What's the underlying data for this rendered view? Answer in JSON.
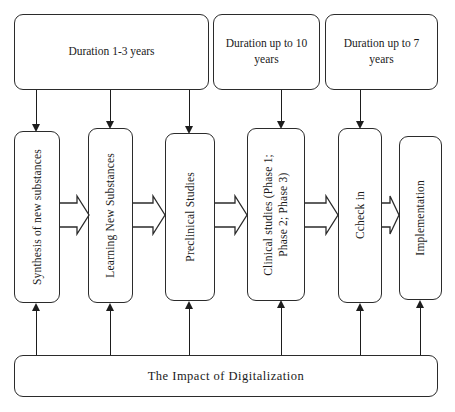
{
  "diagram": {
    "title_bar": {
      "label": "The Impact of Digitalization"
    },
    "duration_boxes": [
      {
        "id": "duration-1-3-years",
        "label": "Duration 1-3 years"
      },
      {
        "id": "duration-up-to-10-years",
        "label": "Duration up to 10\nyears"
      },
      {
        "id": "duration-up-to-7-years",
        "label": "Duration\nup to 7 years"
      }
    ],
    "stages": [
      {
        "id": "synthesis-of-new-substances",
        "label": "Synthesis of new substances"
      },
      {
        "id": "learning-new-substances",
        "label": "Learning New Substances"
      },
      {
        "id": "preclinical-studies",
        "label": "Preclinical Studies"
      },
      {
        "id": "clinical-studies",
        "label": "Clinical studies (Phase 1;\nPhase 2; Phase 3)"
      },
      {
        "id": "ccheck-in",
        "label": "Ccheck in"
      },
      {
        "id": "implementation",
        "label": "Implementation"
      }
    ],
    "colors": {
      "stroke": "#2b2b2b",
      "arrow": "#1d1d1d",
      "background": "#ffffff",
      "text": "#1a1a1a"
    }
  }
}
